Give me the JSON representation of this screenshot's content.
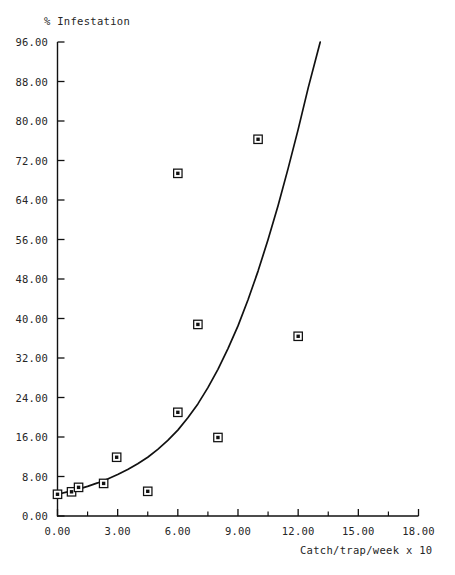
{
  "chart_data": {
    "type": "scatter",
    "title": "",
    "xlabel": "Catch/trap/week x 10",
    "ylabel": "% Infestation",
    "xlim": [
      0,
      18
    ],
    "ylim": [
      0,
      96
    ],
    "grid": false,
    "legend": "none",
    "xticks": [
      "0.00",
      "3.00",
      "6.00",
      "9.00",
      "12.00",
      "15.00",
      "18.00"
    ],
    "xtick_values": [
      0,
      3,
      6,
      9,
      12,
      15,
      18
    ],
    "xminor_step": 1.5,
    "yticks": [
      "0.00",
      "8.00",
      "16.00",
      "24.00",
      "32.00",
      "40.00",
      "48.00",
      "56.00",
      "64.00",
      "72.00",
      "80.00",
      "88.00",
      "96.00"
    ],
    "ytick_values": [
      0,
      8,
      16,
      24,
      32,
      40,
      48,
      56,
      64,
      72,
      80,
      88,
      96
    ],
    "marker": "open-square-with-dot",
    "marker_color": "#111111",
    "points": [
      {
        "x": 0.0,
        "y": 4.4
      },
      {
        "x": 0.7,
        "y": 4.9
      },
      {
        "x": 1.05,
        "y": 5.8
      },
      {
        "x": 2.3,
        "y": 6.6
      },
      {
        "x": 2.95,
        "y": 11.9
      },
      {
        "x": 4.5,
        "y": 5.0
      },
      {
        "x": 6.0,
        "y": 21.0
      },
      {
        "x": 6.0,
        "y": 69.4
      },
      {
        "x": 7.0,
        "y": 38.8
      },
      {
        "x": 8.0,
        "y": 15.9
      },
      {
        "x": 10.0,
        "y": 76.3
      },
      {
        "x": 12.0,
        "y": 36.4
      }
    ],
    "fitted_curve": {
      "name": "exponential fit",
      "color": "#111111",
      "x": [
        0.0,
        0.5,
        1.0,
        1.5,
        2.0,
        2.5,
        3.0,
        3.5,
        4.0,
        4.5,
        5.0,
        5.5,
        6.0,
        6.5,
        7.0,
        7.5,
        8.0,
        8.5,
        9.0,
        9.5,
        10.0,
        10.5,
        11.0,
        11.5,
        12.0,
        12.5,
        13.1
      ],
      "y": [
        4.4,
        4.9,
        5.4,
        6.0,
        6.7,
        7.5,
        8.4,
        9.4,
        10.6,
        11.9,
        13.5,
        15.3,
        17.4,
        19.9,
        22.7,
        26.0,
        29.7,
        33.9,
        38.5,
        43.8,
        49.6,
        56.0,
        62.9,
        70.4,
        78.3,
        86.7,
        96.0
      ]
    }
  },
  "axes": {
    "y_axis_title": "% Infestation",
    "x_axis_title": "Catch/trap/week x 10"
  },
  "footer": {
    "partial_text": ""
  }
}
